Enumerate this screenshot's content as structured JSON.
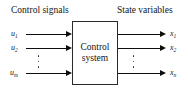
{
  "diagram": {
    "title_left": "Control signals",
    "title_right": "State variables",
    "block": {
      "line1": "Control",
      "line2": "system"
    },
    "inputs": [
      {
        "name": "u",
        "sub": "1"
      },
      {
        "name": "u",
        "sub": "2"
      },
      {
        "name": "u",
        "sub": "m"
      }
    ],
    "outputs": [
      {
        "name": "x",
        "sub": "1"
      },
      {
        "name": "x",
        "sub": "2"
      },
      {
        "name": "x",
        "sub": "n"
      }
    ],
    "ellipsis_left": "⋮",
    "ellipsis_right": "⋮",
    "colors": {
      "line": "#0d0d0d",
      "box_border": "#2a2a2a",
      "text": "#141414",
      "background": "#ffffff"
    }
  }
}
